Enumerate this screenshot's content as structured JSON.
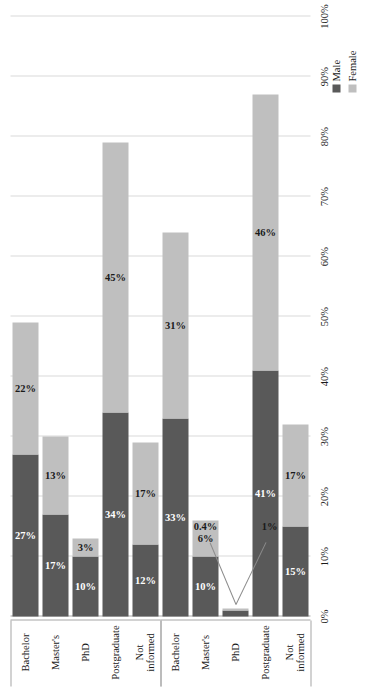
{
  "chart_data": {
    "type": "bar",
    "subtype": "stacked-horizontal-grouped",
    "title": "",
    "xlabel": "",
    "ylabel": "",
    "orientation": "rotated-90-ccw",
    "axis": {
      "range": [
        0,
        100
      ],
      "unit": "%",
      "grid": true,
      "tick_labels": [
        "0%",
        "10%",
        "20%",
        "30%",
        "40%",
        "50%",
        "60%",
        "70%",
        "80%",
        "90%",
        "100%"
      ],
      "tick_values": [
        0,
        10,
        20,
        30,
        40,
        50,
        60,
        70,
        80,
        90,
        100
      ]
    },
    "legend": {
      "position": "bottom-right",
      "entries": [
        {
          "name": "Male",
          "color": "#595959"
        },
        {
          "name": "Female",
          "color": "#bfbfbf"
        }
      ]
    },
    "groups": [
      {
        "name": "Partners",
        "categories": [
          {
            "label": "Bachelor",
            "male": 27,
            "female": 22,
            "male_label": "27%",
            "female_label": "22%",
            "callout": false
          },
          {
            "label": "Master's",
            "male": 17,
            "female": 13,
            "male_label": "17%",
            "female_label": "13%",
            "callout": false
          },
          {
            "label": "PhD",
            "male": 10,
            "female": 3,
            "male_label": "10%",
            "female_label": "3%",
            "callout": false
          },
          {
            "label": "Postgraduate",
            "male": 34,
            "female": 45,
            "male_label": "34%",
            "female_label": "45%",
            "callout": false
          },
          {
            "label": "Not\ninformed",
            "male": 12,
            "female": 17,
            "male_label": "12%",
            "female_label": "17%",
            "callout": false
          }
        ]
      },
      {
        "name": "Associates",
        "categories": [
          {
            "label": "Bachelor",
            "male": 33,
            "female": 31,
            "male_label": "33%",
            "female_label": "31%",
            "callout": false
          },
          {
            "label": "Master's",
            "male": 10,
            "female": 6,
            "male_label": "10%",
            "female_label": "6%",
            "callout": false
          },
          {
            "label": "PhD",
            "male": 1,
            "female": 0.4,
            "male_label": "1%",
            "female_label": "0.4%",
            "callout": true
          },
          {
            "label": "Postgraduate",
            "male": 41,
            "female": 46,
            "male_label": "41%",
            "female_label": "46%",
            "callout": false
          },
          {
            "label": "Not\ninformed",
            "male": 15,
            "female": 17,
            "male_label": "15%",
            "female_label": "17%",
            "callout": false
          }
        ]
      }
    ]
  }
}
